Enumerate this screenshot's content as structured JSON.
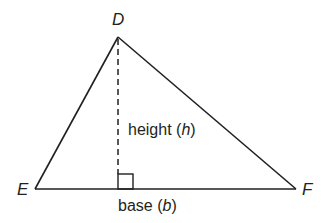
{
  "diagram": {
    "type": "triangle",
    "colors": {
      "stroke": "#231f20",
      "background": "#ffffff"
    },
    "vertices": {
      "D": {
        "label": "D",
        "x": 118,
        "y": 37
      },
      "E": {
        "label": "E",
        "x": 35,
        "y": 189
      },
      "F": {
        "label": "F",
        "x": 296,
        "y": 189
      }
    },
    "height": {
      "prefix": "height (",
      "variable": "h",
      "suffix": ")",
      "foot": {
        "x": 118,
        "y": 189
      },
      "style": "dashed"
    },
    "base": {
      "prefix": "base (",
      "variable": "b",
      "suffix": ")"
    },
    "right_angle_marker": {
      "x": 118,
      "y": 174,
      "size": 15
    }
  }
}
